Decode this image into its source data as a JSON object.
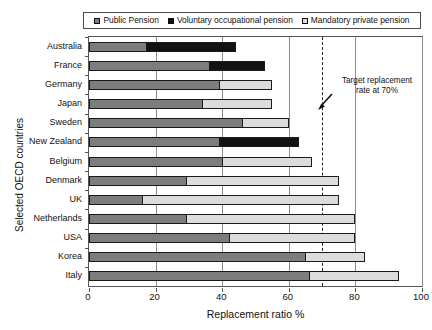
{
  "chart_data": {
    "type": "bar",
    "orientation": "horizontal",
    "stacked": true,
    "title": "",
    "xlabel": "Replacement ratio %",
    "ylabel": "Selected OECD countries",
    "xlim": [
      0,
      100
    ],
    "xticks": [
      0,
      20,
      40,
      60,
      80,
      100
    ],
    "grid": true,
    "legend_position": "top",
    "categories": [
      "Australia",
      "France",
      "Germany",
      "Japan",
      "Sweden",
      "New Zealand",
      "Belgium",
      "Denmark",
      "UK",
      "Netherlands",
      "USA",
      "Korea",
      "Italy"
    ],
    "series": [
      {
        "name": "Public Pension",
        "color": "#7d7d7d",
        "values": [
          17,
          36,
          39,
          34,
          46,
          39,
          40,
          29,
          16,
          29,
          42,
          65,
          66
        ]
      },
      {
        "name": "Voluntary occupational pension",
        "color": "#121212",
        "values": [
          27,
          17,
          0,
          0,
          0,
          24,
          0,
          0,
          0,
          0,
          0,
          0,
          0
        ]
      },
      {
        "name": "Mandatory private pension",
        "color": "#dcdcdc",
        "values": [
          0,
          0,
          16,
          21,
          14,
          0,
          27,
          46,
          59,
          51,
          38,
          18,
          27
        ]
      }
    ],
    "totals": [
      44,
      53,
      55,
      55,
      60,
      63,
      67,
      75,
      75,
      80,
      80,
      83,
      93
    ],
    "annotation": {
      "text_line1": "Target replacement",
      "text_line2": "rate at 70%",
      "value": 70,
      "line_style": "dashed"
    }
  },
  "legend": {
    "entries": [
      {
        "label": "Public Pension"
      },
      {
        "label": "Voluntary occupational pension"
      },
      {
        "label": "Mandatory private pension"
      }
    ]
  },
  "axes": {
    "x_title": "Replacement ratio %",
    "y_title": "Selected OECD countries",
    "x_tick_labels": [
      "0",
      "20",
      "40",
      "60",
      "80",
      "100"
    ],
    "y_tick_labels": [
      "Australia",
      "France",
      "Germany",
      "Japan",
      "Sweden",
      "New Zealand",
      "Belgium",
      "Denmark",
      "UK",
      "Netherlands",
      "USA",
      "Korea",
      "Italy"
    ]
  }
}
